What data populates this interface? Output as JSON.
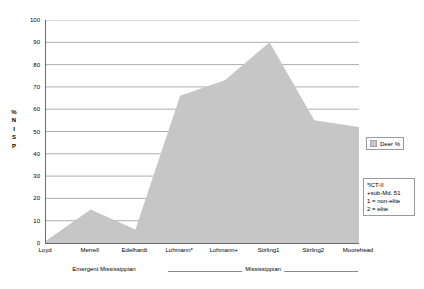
{
  "chart_data": {
    "type": "area",
    "title": "",
    "xlabel": "",
    "ylabel": "% NISP",
    "ylim": [
      0,
      100
    ],
    "ytick_step": 10,
    "grid": true,
    "legend_position": "right",
    "categories": [
      "Loyd",
      "Merrell",
      "Edelhardt",
      "Lohmann*",
      "Lohmann+",
      "Stirling1",
      "Stirling2",
      "Moorehead"
    ],
    "series": [
      {
        "name": "Deer %",
        "color": "#c6c6c6",
        "values": [
          1,
          15,
          6,
          66,
          73,
          90,
          55,
          52
        ]
      }
    ],
    "ytick_labels": [
      "0",
      "10",
      "20",
      "30",
      "40",
      "50",
      "60",
      "70",
      "80",
      "90",
      "100"
    ],
    "y_axis_title_letters": [
      "%",
      "N",
      "I",
      "S",
      "P"
    ],
    "period_bands": [
      {
        "id": "emergent",
        "label": "Emergent Mississippian",
        "from": "Loyd",
        "to": "Edelhardt"
      },
      {
        "id": "mississippian",
        "label": "Mississippian",
        "from": "Lohmann*",
        "to": "Moorehead"
      }
    ],
    "annotations": [
      "*lCT-II",
      "+sub-Md. 51",
      "1 = non-elite",
      "2 = elite"
    ]
  },
  "legend": {
    "entries": [
      {
        "label": "Deer %",
        "color": "#c6c6c6"
      }
    ]
  },
  "colors": {
    "area_fill": "#c6c6c6",
    "axis": "#6b6b6b",
    "gridline": "#8a8a8a",
    "text": "#000000",
    "background": "#ffffff"
  }
}
